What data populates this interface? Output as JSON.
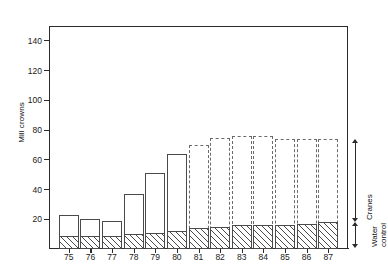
{
  "chart_data": {
    "type": "bar",
    "title": "",
    "subtitle": "",
    "xlabel": "",
    "ylabel": "Mill crowns",
    "ylim": [
      0,
      150
    ],
    "yticks": [
      20,
      40,
      60,
      80,
      100,
      120,
      140
    ],
    "ytick_labels": [
      "20",
      "40",
      "60",
      "80",
      "100",
      "120",
      "140"
    ],
    "grid": false,
    "stacked": true,
    "legend_position": "right-outside",
    "categories": [
      "75",
      "76",
      "77",
      "78",
      "79",
      "80",
      "81",
      "82",
      "83",
      "84",
      "85",
      "86",
      "87"
    ],
    "series": [
      {
        "name": "Water control",
        "key": "water_control",
        "values": [
          9,
          9,
          9,
          10,
          11,
          12,
          14,
          15,
          16,
          16,
          16,
          17,
          18
        ]
      },
      {
        "name": "Cranes",
        "key": "cranes",
        "values": [
          14,
          11,
          10,
          27,
          40,
          52,
          56,
          60,
          60,
          60,
          58,
          57,
          56
        ]
      }
    ],
    "totals": [
      23,
      20,
      19,
      37,
      51,
      64,
      70,
      75,
      76,
      76,
      74,
      74,
      74
    ],
    "bar_styles": [
      "solid",
      "solid",
      "solid",
      "solid",
      "solid",
      "solid",
      "dashed",
      "dashed",
      "dashed",
      "dashed",
      "dashed",
      "dashed",
      "dashed"
    ],
    "annotations": [
      {
        "name": "cranes-bracket",
        "label": "Cranes",
        "from": 18,
        "to": 74
      },
      {
        "name": "water-control-bracket",
        "label": "Water\ncontrol",
        "label_line1": "Water",
        "label_line2": "control",
        "from": 0,
        "to": 18
      }
    ]
  }
}
